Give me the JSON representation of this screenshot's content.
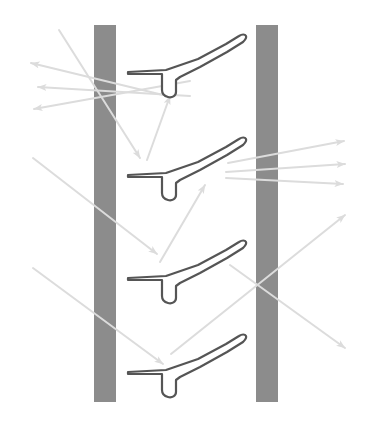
{
  "figure": {
    "canvas": {
      "width": 370,
      "height": 424,
      "background": "#ffffff"
    },
    "colors": {
      "wall": "#8c8c8c",
      "blade_outline": "#555555",
      "blade_fill": "#ffffff",
      "arrow": "#dcdcdc",
      "background": "#ffffff"
    }
  },
  "walls": [
    {
      "name": "left-wall",
      "label": "left wall",
      "x": 94,
      "y": 25,
      "width": 22,
      "height": 377,
      "color": "#8c8c8c"
    },
    {
      "name": "right-wall",
      "label": "right wall",
      "x": 256,
      "y": 25,
      "width": 22,
      "height": 377,
      "color": "#8c8c8c"
    }
  ],
  "blades": [
    {
      "name": "blade-1",
      "label": "blade 1",
      "offset_x": 0,
      "offset_y": 0
    },
    {
      "name": "blade-2",
      "label": "blade 2",
      "offset_x": 0,
      "offset_y": 103
    },
    {
      "name": "blade-3",
      "label": "blade 3",
      "offset_x": 0,
      "offset_y": 206
    },
    {
      "name": "blade-4",
      "label": "blade 4",
      "offset_x": 0,
      "offset_y": 300
    }
  ],
  "blade_geometry": {
    "description": "thin flat leading edge, downward hook, tapered trailing wedge to upper right",
    "upper_path": "M 128 72 L 165 70 L 196 60 L 225 45 L 240 36 L 244 33",
    "lower_path": "M 244 33 L 247 36 L 244 41 L 228 52 L 200 67 L 180 76 L 173 80 L 173 91 L 171 94 L 166 95 L 162 93 L 161 89 L 161 73 L 128 74 Z",
    "tip_note": "rounded trailing tip at upper right"
  },
  "arrows": {
    "inlet_upper_left": {
      "name": "inlet-arrow-upper",
      "label": "incoming flow, upper",
      "from": [
        59,
        30
      ],
      "to": [
        140,
        158
      ]
    },
    "inlet_mid_left": {
      "name": "inlet-arrow-middle",
      "label": "incoming flow, middle",
      "from": [
        33,
        158
      ],
      "to": [
        157,
        254
      ]
    },
    "inlet_lower_left": {
      "name": "inlet-arrow-lower",
      "label": "incoming flow, lower",
      "from": [
        33,
        268
      ],
      "to": [
        163,
        364
      ]
    },
    "reflected_left": [
      {
        "name": "reflected-arrow-1",
        "label": "reflected flow 1",
        "from": [
          163,
          95
        ],
        "to": [
          31,
          63
        ]
      },
      {
        "name": "reflected-arrow-2",
        "label": "reflected flow 2",
        "from": [
          190,
          96
        ],
        "to": [
          38,
          87
        ]
      },
      {
        "name": "reflected-arrow-3",
        "label": "reflected flow 3",
        "from": [
          190,
          81
        ],
        "to": [
          34,
          109
        ]
      }
    ],
    "deflected_up": [
      {
        "name": "deflected-arrow-1",
        "label": "deflected flow 1",
        "from": [
          147,
          160
        ],
        "to": [
          170,
          96
        ]
      },
      {
        "name": "deflected-arrow-2",
        "label": "deflected flow 2",
        "from": [
          160,
          262
        ],
        "to": [
          205,
          185
        ]
      }
    ],
    "outlet_right": [
      {
        "name": "outlet-arrow-1",
        "label": "outgoing flow 1",
        "from": [
          228,
          163
        ],
        "to": [
          344,
          141
        ]
      },
      {
        "name": "outlet-arrow-2",
        "label": "outgoing flow 2",
        "from": [
          226,
          172
        ],
        "to": [
          345,
          164
        ]
      },
      {
        "name": "outlet-arrow-3",
        "label": "outgoing flow 3",
        "from": [
          226,
          178
        ],
        "to": [
          343,
          184
        ]
      }
    ],
    "crossing": [
      {
        "name": "outlet-arrow-diagonal-up",
        "label": "outgoing flow, rising diagonal",
        "from": [
          171,
          354
        ],
        "to": [
          345,
          215
        ]
      },
      {
        "name": "outlet-arrow-diagonal-down",
        "label": "outgoing flow, descending diagonal",
        "from": [
          230,
          265
        ],
        "to": [
          345,
          348
        ]
      }
    ]
  }
}
